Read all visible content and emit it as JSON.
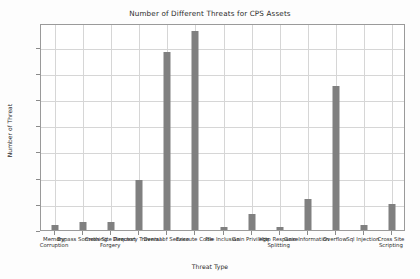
{
  "chart_data": {
    "type": "bar",
    "title": "Number of Different Threats for CPS Assets",
    "xlabel": "Threat Type",
    "ylabel": "Number of Threat",
    "categories": [
      "Memory Corruption",
      "Bypass Something",
      "Cross-Site Request Forgery",
      "Directory Traversal",
      "Denial of Service",
      "Execute Code",
      "File Inclusion",
      "Gain Privilege",
      "Http Response Splitting",
      "Gain Information",
      "Overflow",
      "Sql Injection",
      "Cross Site Scripting"
    ],
    "values": [
      2,
      3,
      3,
      19,
      68,
      76,
      1,
      6,
      1,
      12,
      55,
      2,
      10
    ],
    "ylim": [
      0,
      79
    ],
    "yticks": [
      0,
      10,
      20,
      30,
      40,
      50,
      60,
      70
    ],
    "ytick_labels": [
      "0",
      "10",
      "20",
      "30",
      "40",
      "50",
      "60",
      "70"
    ],
    "grid": true,
    "legend": false,
    "bar_color": "#808080",
    "grid_color": "#d6d6d6",
    "axis_color": "#9a9a9a",
    "background_color": "#ffffff"
  }
}
